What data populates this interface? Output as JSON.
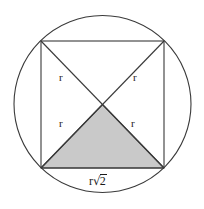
{
  "figure": {
    "background_color": "#ffffff",
    "stroke_color": "#3a3a3a",
    "shade_color": "#c9c9c9",
    "text_color": "#1a1a1a"
  },
  "circle": {
    "name": "circumscribed-circle",
    "center_x": 102.5,
    "center_y": 104.0,
    "radius": 88.5
  },
  "square": {
    "name": "inscribed-square",
    "left": 41,
    "top": 41,
    "right": 164,
    "bottom": 168,
    "side": 123,
    "corners": [
      {
        "name": "top-left",
        "x": 41,
        "y": 41
      },
      {
        "name": "top-right",
        "x": 164,
        "y": 41
      },
      {
        "name": "bottom-right",
        "x": 164,
        "y": 168
      },
      {
        "name": "bottom-left",
        "x": 41,
        "y": 168
      }
    ]
  },
  "diagonals": [
    {
      "name": "diagonal-tl-br",
      "x1": 41,
      "y1": 41,
      "x2": 164,
      "y2": 168
    },
    {
      "name": "diagonal-tr-bl",
      "x1": 164,
      "y1": 41,
      "x2": 41,
      "y2": 168
    }
  ],
  "center_point": {
    "x": 102.5,
    "y": 104.5
  },
  "shaded_triangle": {
    "name": "shaded-lower-triangle",
    "points": "102.5,104.5 41,168 164,168",
    "fill": "#c9c9c9"
  },
  "labels": {
    "radius_top_left": {
      "text": "r",
      "x": 59,
      "y": 72
    },
    "radius_top_right": {
      "text": "r",
      "x": 133,
      "y": 72
    },
    "radius_bottom_left": {
      "text": "r",
      "x": 59,
      "y": 118
    },
    "radius_bottom_right": {
      "text": "r",
      "x": 131,
      "y": 118
    },
    "side_label": {
      "prefix": "r",
      "radical_symbol": "√",
      "radicand": "2",
      "full_text": "r√2",
      "x": 89,
      "y": 174
    }
  }
}
